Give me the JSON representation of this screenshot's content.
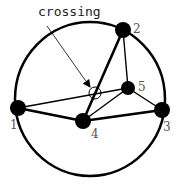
{
  "diagram": {
    "annotation": "crossing",
    "colors": {
      "stroke": "#000000",
      "label": "#555555",
      "background": "#ffffff"
    },
    "outer_circle": {
      "cx": 90,
      "cy": 99,
      "rx": 75,
      "ry": 77
    },
    "nodes": [
      {
        "id": "1",
        "label": "1",
        "cx": 18,
        "cy": 108,
        "r": 8,
        "lx": 10,
        "ly": 129
      },
      {
        "id": "2",
        "label": "2",
        "cx": 123,
        "cy": 30,
        "r": 8,
        "lx": 133,
        "ly": 33
      },
      {
        "id": "3",
        "label": "3",
        "cx": 162,
        "cy": 110,
        "r": 8,
        "lx": 163,
        "ly": 131
      },
      {
        "id": "4",
        "label": "4",
        "cx": 83,
        "cy": 121,
        "r": 8,
        "lx": 91,
        "ly": 138
      },
      {
        "id": "5",
        "label": "5",
        "cx": 128,
        "cy": 88,
        "r": 7,
        "lx": 138,
        "ly": 91
      }
    ],
    "edges": [
      {
        "from": "1",
        "to": "4",
        "weight": "thick"
      },
      {
        "from": "4",
        "to": "3",
        "weight": "thick"
      },
      {
        "from": "4",
        "to": "2",
        "weight": "thick"
      },
      {
        "from": "1",
        "to": "5",
        "weight": "thin"
      },
      {
        "from": "2",
        "to": "5",
        "weight": "thin"
      },
      {
        "from": "5",
        "to": "3",
        "weight": "thin"
      },
      {
        "from": "4",
        "to": "5",
        "weight": "thin"
      }
    ],
    "crossing_marker": {
      "cx": 95,
      "cy": 93,
      "r": 6
    },
    "arrow": {
      "x1": 47,
      "y1": 26,
      "x2": 90,
      "y2": 87
    }
  }
}
